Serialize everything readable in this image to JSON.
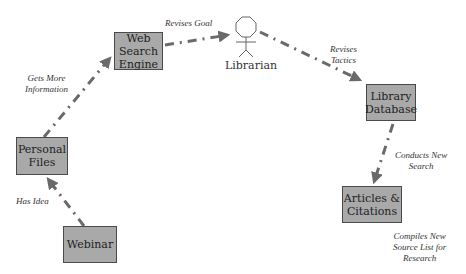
{
  "colors": {
    "node_fill": "#a9a9a9",
    "node_border": "#4a4a4a",
    "edge": "#6a6a6a",
    "background": "#ffffff"
  },
  "nodes": {
    "webinar": {
      "label": "Webinar"
    },
    "personal_files": {
      "label": "Personal\nFiles"
    },
    "web_search_engine": {
      "label": "Web\nSearch\nEngine"
    },
    "library_database": {
      "label": "Library\nDatabase"
    },
    "articles_citations": {
      "label": "Articles &\nCitations"
    }
  },
  "actor": {
    "label": "Librarian",
    "icon": "stick-figure-octagon-head-icon"
  },
  "edges": [
    {
      "from": "webinar",
      "to": "personal_files",
      "label": "Has Idea"
    },
    {
      "from": "personal_files",
      "to": "web_search_engine",
      "label": "Gets More\nInformation"
    },
    {
      "from": "web_search_engine",
      "to": "librarian",
      "label": "Revises Goal"
    },
    {
      "from": "librarian",
      "to": "library_database",
      "label": "Revises\nTactics"
    },
    {
      "from": "library_database",
      "to": "articles_citations",
      "label": "Conducts New\nSearch"
    },
    {
      "from": "articles_citations",
      "to": null,
      "label": "Compiles New\nSource List for\nResearch"
    }
  ]
}
